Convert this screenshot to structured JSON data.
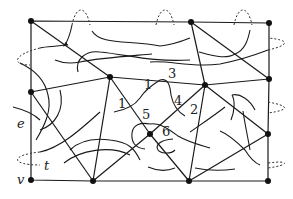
{
  "diagram": {
    "type": "planar graph with medial/transition curves",
    "colors": {
      "edge": "#1a1a1a",
      "curve": "#1a1a1a",
      "dashed": "#333333",
      "vertex": "#111111",
      "background": "#ffffff"
    },
    "labels": {
      "e": "e",
      "t": "t",
      "v": "v",
      "n1a": "1",
      "n1b": "1",
      "n2": "2",
      "n3": "3",
      "n4": "4",
      "n5": "5",
      "n6": "6"
    },
    "vertices": [
      {
        "id": "v1",
        "x": 31,
        "y": 21
      },
      {
        "id": "v2",
        "x": 191,
        "y": 22
      },
      {
        "id": "v3",
        "x": 269,
        "y": 23
      },
      {
        "id": "v4",
        "x": 110,
        "y": 77
      },
      {
        "id": "v5",
        "x": 205,
        "y": 85
      },
      {
        "id": "v6",
        "x": 269,
        "y": 79
      },
      {
        "id": "v7",
        "x": 31,
        "y": 92
      },
      {
        "id": "v8",
        "x": 150,
        "y": 134
      },
      {
        "id": "v9",
        "x": 268,
        "y": 134
      },
      {
        "id": "v10",
        "x": 31,
        "y": 180
      },
      {
        "id": "v11",
        "x": 93,
        "y": 181
      },
      {
        "id": "v12",
        "x": 189,
        "y": 181
      },
      {
        "id": "v13",
        "x": 268,
        "y": 181
      }
    ]
  }
}
